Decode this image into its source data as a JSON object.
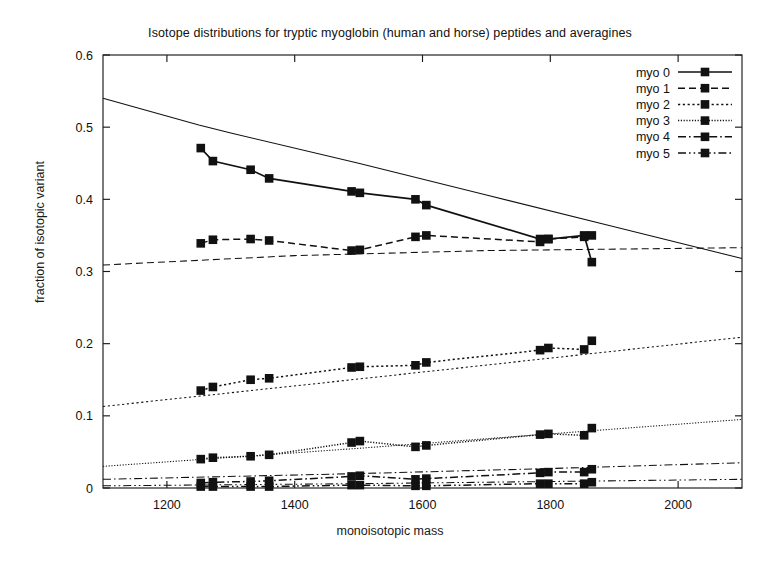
{
  "chart_data": {
    "type": "line",
    "title": "Isotope distributions for tryptic myoglobin (human and horse) peptides and averagines",
    "xlabel": "monoisotopic mass",
    "ylabel": "fraction of isotopic variant",
    "xlim": [
      1100,
      2100
    ],
    "ylim": [
      0,
      0.6
    ],
    "xticks": [
      1200,
      1400,
      1600,
      1800,
      2000
    ],
    "xtick_labels": [
      "1200",
      "1400",
      "1600",
      "1800",
      "2000"
    ],
    "yticks": [
      0,
      0.1,
      0.2,
      0.3,
      0.4,
      0.5,
      0.6
    ],
    "ytick_labels": [
      "0",
      "0.1",
      "0.2",
      "0.3",
      "0.4",
      "0.5",
      "0.6"
    ],
    "grid": false,
    "legend_position": "top-right",
    "legend_entries": [
      "myo 0",
      "myo 1",
      "myo 2",
      "myo 3",
      "myo 4",
      "myo 5"
    ],
    "series": [
      {
        "name": "myo 0",
        "dash": "solid",
        "marker": "square",
        "x": [
          1253,
          1272,
          1331,
          1360,
          1489,
          1502,
          1589,
          1606,
          1784,
          1797,
          1853,
          1865
        ],
        "y": [
          0.471,
          0.453,
          0.441,
          0.429,
          0.411,
          0.409,
          0.4,
          0.392,
          0.345,
          0.345,
          0.35,
          0.313
        ]
      },
      {
        "name": "myo 1",
        "dash": "dashed",
        "marker": "square",
        "x": [
          1253,
          1272,
          1331,
          1360,
          1489,
          1502,
          1589,
          1606,
          1784,
          1797,
          1853,
          1865
        ],
        "y": [
          0.339,
          0.344,
          0.345,
          0.343,
          0.329,
          0.33,
          0.348,
          0.35,
          0.341,
          0.345,
          0.348,
          0.35
        ]
      },
      {
        "name": "myo 2",
        "dash": "dotted",
        "marker": "square",
        "x": [
          1253,
          1272,
          1331,
          1360,
          1489,
          1502,
          1589,
          1606,
          1784,
          1797,
          1853,
          1865
        ],
        "y": [
          0.135,
          0.14,
          0.15,
          0.152,
          0.167,
          0.168,
          0.17,
          0.174,
          0.191,
          0.194,
          0.192,
          0.204
        ]
      },
      {
        "name": "myo 3",
        "dash": "finedot",
        "marker": "square",
        "x": [
          1253,
          1272,
          1331,
          1360,
          1489,
          1502,
          1589,
          1606,
          1784,
          1797,
          1853,
          1865
        ],
        "y": [
          0.04,
          0.042,
          0.044,
          0.046,
          0.063,
          0.065,
          0.057,
          0.059,
          0.074,
          0.075,
          0.073,
          0.083
        ]
      },
      {
        "name": "myo 4",
        "dash": "dashdot",
        "marker": "square",
        "x": [
          1253,
          1272,
          1331,
          1360,
          1489,
          1502,
          1589,
          1606,
          1784,
          1797,
          1853,
          1865
        ],
        "y": [
          0.007,
          0.008,
          0.009,
          0.01,
          0.016,
          0.017,
          0.012,
          0.013,
          0.021,
          0.022,
          0.022,
          0.026
        ]
      },
      {
        "name": "myo 5",
        "dash": "dashdotdot",
        "marker": "square",
        "x": [
          1253,
          1272,
          1331,
          1360,
          1489,
          1502,
          1589,
          1606,
          1784,
          1797,
          1853,
          1865
        ],
        "y": [
          0.002,
          0.002,
          0.002,
          0.002,
          0.004,
          0.004,
          0.003,
          0.003,
          0.006,
          0.006,
          0.006,
          0.008
        ]
      }
    ],
    "averagines": [
      {
        "name": "myo 0 averagine",
        "dash": "solid",
        "x": [
          1100,
          1250,
          1300,
          1500,
          1700,
          1900,
          2100
        ],
        "y": [
          0.54,
          0.503,
          0.492,
          0.45,
          0.406,
          0.362,
          0.318
        ]
      },
      {
        "name": "myo 1 averagine",
        "dash": "dashed",
        "x": [
          1100,
          1400,
          1700,
          2100
        ],
        "y": [
          0.309,
          0.322,
          0.329,
          0.333
        ]
      },
      {
        "name": "myo 2 averagine",
        "dash": "dotted",
        "x": [
          1100,
          1500,
          1800,
          2100
        ],
        "y": [
          0.113,
          0.151,
          0.18,
          0.209
        ]
      },
      {
        "name": "myo 3 averagine",
        "dash": "finedot",
        "x": [
          1100,
          1500,
          1800,
          2100
        ],
        "y": [
          0.03,
          0.055,
          0.075,
          0.095
        ]
      },
      {
        "name": "myo 4 averagine",
        "dash": "dashdot",
        "x": [
          1100,
          1500,
          1800,
          2100
        ],
        "y": [
          0.012,
          0.02,
          0.027,
          0.035
        ]
      },
      {
        "name": "myo 5 averagine",
        "dash": "dashdotdot",
        "x": [
          1100,
          1500,
          1800,
          2100
        ],
        "y": [
          0.003,
          0.006,
          0.009,
          0.012
        ]
      }
    ]
  }
}
